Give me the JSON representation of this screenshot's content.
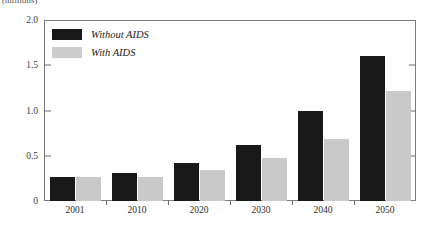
{
  "units_caption": "(millions)",
  "legend": {
    "position": "inside-top-left",
    "entries": [
      {
        "label": "Without AIDS",
        "color": "#191919",
        "key": "without_aids"
      },
      {
        "label": "With AIDS",
        "color": "#c9c9c9",
        "key": "with_aids"
      }
    ]
  },
  "axes": {
    "y_ticks": [
      "0",
      "0.5",
      "1.0",
      "1.5",
      "2.0"
    ],
    "y_tick_values": [
      0,
      0.5,
      1.0,
      1.5,
      2.0
    ],
    "y_min": 0,
    "y_max": 2.0,
    "x_ticks": [
      "2001",
      "2010",
      "2020",
      "2030",
      "2040",
      "2050"
    ]
  },
  "chart_data": {
    "type": "bar",
    "title": "",
    "subtitle": "",
    "xlabel": "",
    "ylabel": "(millions)",
    "categories": [
      "2001",
      "2010",
      "2020",
      "2030",
      "2040",
      "2050"
    ],
    "series": [
      {
        "name": "Without AIDS",
        "color": "#191919",
        "values": [
          0.27,
          0.31,
          0.42,
          0.62,
          0.99,
          1.6
        ]
      },
      {
        "name": "With AIDS",
        "color": "#c9c9c9",
        "values": [
          0.27,
          0.27,
          0.34,
          0.47,
          0.69,
          1.22
        ]
      }
    ],
    "ylim": [
      0,
      2.0
    ],
    "ytick_labels": [
      "0",
      "0.5",
      "1.0",
      "1.5",
      "2.0"
    ],
    "grid": false,
    "legend_position": "inside-top-left",
    "orientation": "vertical",
    "bar_group_mode": "grouped"
  }
}
